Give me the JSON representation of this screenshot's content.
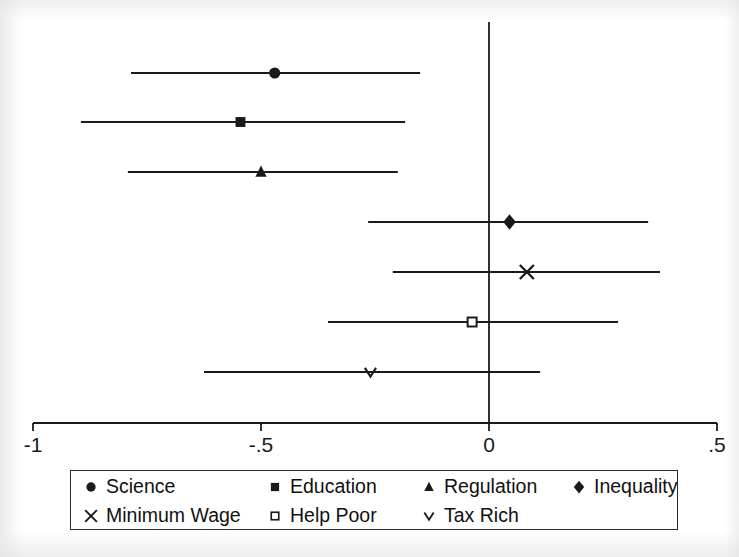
{
  "chart_data": {
    "type": "scatter",
    "subtype": "coefficient-plot",
    "title": "",
    "xlabel": "",
    "ylabel": "",
    "xlim": [
      -1.05,
      0.55
    ],
    "xticks": [
      -1,
      -0.5,
      0,
      0.5
    ],
    "xtick_labels": [
      "-1",
      "-.5",
      "0",
      ".5"
    ],
    "grid": false,
    "zero_reference_line": 0,
    "legend_position": "below-axis",
    "series": [
      {
        "name": "Science",
        "marker": "filled-circle",
        "estimate": -0.47,
        "ci_low": -0.785,
        "ci_high": -0.151
      },
      {
        "name": "Education",
        "marker": "filled-square",
        "estimate": -0.545,
        "ci_low": -0.895,
        "ci_high": -0.184
      },
      {
        "name": "Regulation",
        "marker": "filled-triangle",
        "estimate": -0.5,
        "ci_low": -0.792,
        "ci_high": -0.2
      },
      {
        "name": "Inequality",
        "marker": "filled-diamond",
        "estimate": 0.045,
        "ci_low": -0.265,
        "ci_high": 0.349
      },
      {
        "name": "Minimum Wage",
        "marker": "cross-x",
        "estimate": 0.083,
        "ci_low": -0.211,
        "ci_high": 0.375
      },
      {
        "name": "Help Poor",
        "marker": "open-square",
        "estimate": -0.037,
        "ci_low": -0.353,
        "ci_high": 0.283
      },
      {
        "name": "Tax Rich",
        "marker": "small-v",
        "estimate": -0.26,
        "ci_low": -0.625,
        "ci_high": 0.112
      }
    ]
  },
  "legend": {
    "rows": [
      [
        {
          "label": "Science",
          "marker": "filled-circle"
        },
        {
          "label": "Education",
          "marker": "filled-square"
        },
        {
          "label": "Regulation",
          "marker": "filled-triangle"
        },
        {
          "label": "Inequality",
          "marker": "filled-diamond"
        }
      ],
      [
        {
          "label": "Minimum Wage",
          "marker": "cross-x"
        },
        {
          "label": "Help Poor",
          "marker": "open-square"
        },
        {
          "label": "Tax Rich",
          "marker": "small-v"
        }
      ]
    ]
  },
  "colors": {
    "ink": "#1a1a1a",
    "background": "#ffffff"
  }
}
